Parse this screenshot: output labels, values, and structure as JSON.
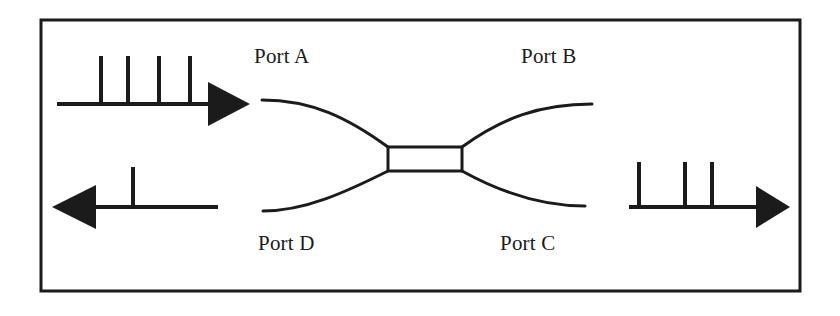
{
  "figure": {
    "background_color": "#ffffff",
    "ink_color": "#1b1b1b",
    "border": {
      "name": "outer-frame",
      "x": 41,
      "y": 20,
      "width": 759,
      "height": 271,
      "stroke_width": 3,
      "color": "#1b1b1b"
    }
  },
  "labels": {
    "port_a": "Port A",
    "port_b": "Port B",
    "port_c": "Port C",
    "port_d": "Port D"
  },
  "coupler": {
    "name": "coupling-region",
    "shape": "rectangle",
    "x": 388,
    "y": 147,
    "width": 74,
    "height": 24,
    "stroke_width": 3,
    "fill": "#ffffff"
  },
  "waveguides": [
    {
      "name": "waveguide-port-a",
      "from_port": "Port A",
      "path": "M 262 100 C 312 100, 348 118, 388 147",
      "stroke_width": 3
    },
    {
      "name": "waveguide-port-b",
      "from_port": "Port B",
      "path": "M 462 147 C 502 118, 540 104, 592 104",
      "stroke_width": 3
    },
    {
      "name": "waveguide-port-d",
      "from_port": "Port D",
      "path": "M 263 211 C 305 211, 346 192, 388 171",
      "stroke_width": 3
    },
    {
      "name": "waveguide-port-c",
      "from_port": "Port C",
      "path": "M 462 171 C 500 192, 540 206, 585 206",
      "stroke_width": 3
    }
  ],
  "signals": [
    {
      "name": "input-pulse-train-port-a",
      "description": "Input pulse train entering Port A, arrow pointing right",
      "direction": "right",
      "pulse_count": 4,
      "baseline_y": 104,
      "line_start_x": 57,
      "line_end_x": 208,
      "arrow_tip_x": 250,
      "arrow_half_height": 22,
      "pulse_height": 48,
      "pulse_x_positions": [
        101,
        128,
        159,
        190
      ],
      "stroke_width": 4
    },
    {
      "name": "output-pulse-train-port-d",
      "description": "Output pulse at Port D, arrow pointing left",
      "direction": "left",
      "pulse_count": 1,
      "baseline_y": 207,
      "line_start_x": 96,
      "line_end_x": 218,
      "arrow_tip_x": 52,
      "arrow_half_height": 22,
      "pulse_height": 40,
      "pulse_x_positions": [
        133
      ],
      "stroke_width": 4
    },
    {
      "name": "output-pulse-train-port-c",
      "description": "Output pulse train at Port C, arrow pointing right",
      "direction": "right",
      "pulse_count": 3,
      "baseline_y": 207,
      "line_start_x": 629,
      "line_end_x": 756,
      "arrow_tip_x": 790,
      "arrow_half_height": 21,
      "pulse_height": 45,
      "pulse_x_positions": [
        639,
        685,
        712
      ],
      "stroke_width": 4
    }
  ]
}
